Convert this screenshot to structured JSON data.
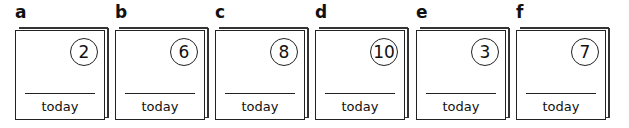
{
  "cards": [
    {
      "letter": "a",
      "number": "2",
      "label": "today"
    },
    {
      "letter": "b",
      "number": "6",
      "label": "today"
    },
    {
      "letter": "c",
      "number": "8",
      "label": "today"
    },
    {
      "letter": "d",
      "number": "10",
      "label": "today"
    },
    {
      "letter": "e",
      "number": "3",
      "label": "today"
    },
    {
      "letter": "f",
      "number": "7",
      "label": "today"
    }
  ]
}
